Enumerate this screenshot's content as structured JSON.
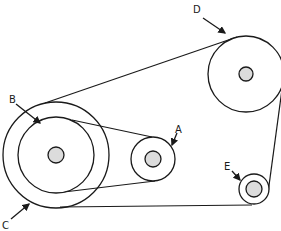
{
  "diagram": {
    "type": "belt-and-pulley system",
    "labels": {
      "A": "A",
      "B": "B",
      "C": "C",
      "D": "D",
      "E": "E"
    },
    "colors": {
      "stroke": "#1a1a1a",
      "hub_fill": "#dcdcdc",
      "background": "#ffffff"
    }
  }
}
